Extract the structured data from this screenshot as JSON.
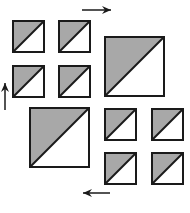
{
  "diagram": {
    "colors": {
      "shade": "#a8a8a8",
      "outline": "#1a1a1a",
      "background": "#ffffff"
    },
    "squares": [
      {
        "id": "tl-1",
        "x": 13,
        "y": 21,
        "size": 31
      },
      {
        "id": "tl-2",
        "x": 59,
        "y": 21,
        "size": 31
      },
      {
        "id": "tl-3",
        "x": 13,
        "y": 66,
        "size": 31
      },
      {
        "id": "tl-4",
        "x": 59,
        "y": 66,
        "size": 31
      },
      {
        "id": "tr-big",
        "x": 105,
        "y": 37,
        "size": 59
      },
      {
        "id": "bl-big",
        "x": 30,
        "y": 108,
        "size": 59
      },
      {
        "id": "br-1",
        "x": 105,
        "y": 109,
        "size": 31
      },
      {
        "id": "br-2",
        "x": 152,
        "y": 109,
        "size": 31
      },
      {
        "id": "br-3",
        "x": 105,
        "y": 153,
        "size": 31
      },
      {
        "id": "br-4",
        "x": 152,
        "y": 153,
        "size": 31
      }
    ],
    "arrows": [
      {
        "id": "arrow-right",
        "direction": "right",
        "x1": 82,
        "y1": 10,
        "x2": 111,
        "y2": 10
      },
      {
        "id": "arrow-up",
        "direction": "up",
        "x1": 5,
        "y1": 110,
        "x2": 5,
        "y2": 83
      },
      {
        "id": "arrow-left",
        "direction": "left",
        "x1": 110,
        "y1": 193,
        "x2": 83,
        "y2": 193
      }
    ]
  }
}
